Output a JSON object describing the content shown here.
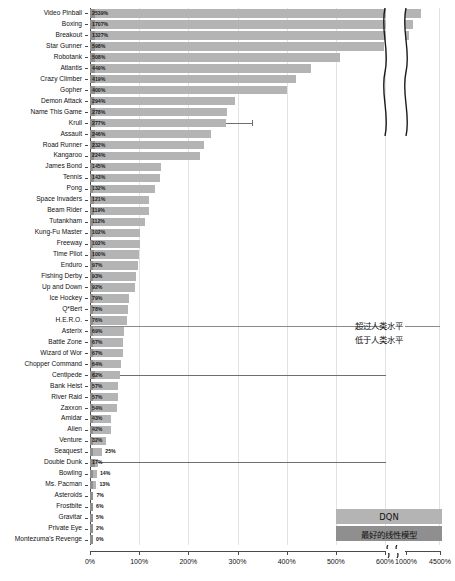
{
  "chart_data": {
    "type": "bar",
    "title": "",
    "xlabel": "",
    "ylabel": "",
    "orientation": "horizontal",
    "grid": true,
    "axis_break": {
      "from": 600,
      "to": 1000
    },
    "xlim": [
      0,
      4500
    ],
    "xticks": [
      {
        "value": 0,
        "label": "0%"
      },
      {
        "value": 100,
        "label": "100%"
      },
      {
        "value": 200,
        "label": "200%"
      },
      {
        "value": 300,
        "label": "300%"
      },
      {
        "value": 400,
        "label": "400%"
      },
      {
        "value": 500,
        "label": "500%"
      },
      {
        "value": 600,
        "label": "600%"
      },
      {
        "value": 1000,
        "label": "1000%"
      },
      {
        "value": 4500,
        "label": "4500%"
      }
    ],
    "reference_line": {
      "value": 100,
      "orientation": "horizontal-separator",
      "after_category": "H.E.R.O."
    },
    "annotations": [
      {
        "text": "超过人类水平",
        "position": "above-reference-line"
      },
      {
        "text": "低于人类水平",
        "position": "below-reference-line"
      }
    ],
    "legend": {
      "position": "bottom-right",
      "entries": [
        {
          "name": "DQN",
          "color": "#b4b4b4"
        },
        {
          "name": "最好的线性模型",
          "color": "#8f8f8f"
        }
      ]
    },
    "categories": [
      "Video Pinball",
      "Boxing",
      "Breakout",
      "Star Gunner",
      "Robotank",
      "Atlantis",
      "Crazy Climber",
      "Gopher",
      "Demon Attack",
      "Name This Game",
      "Krull",
      "Assault",
      "Road Runner",
      "Kangaroo",
      "James Bond",
      "Tennis",
      "Pong",
      "Space Invaders",
      "Beam Rider",
      "Tutankham",
      "Kung-Fu Master",
      "Freeway",
      "Time Pilot",
      "Enduro",
      "Fishing Derby",
      "Up and Down",
      "Ice Hockey",
      "Q*Bert",
      "H.E.R.O.",
      "Asterix",
      "Battle Zone",
      "Wizard of Wor",
      "Chopper Command",
      "Centipede",
      "Bank Heist",
      "River Raid",
      "Zaxxon",
      "Amidar",
      "Alien",
      "Venture",
      "Seaquest",
      "Double Dunk",
      "Bowling",
      "Ms. Pacman",
      "Asteroids",
      "Frostbite",
      "Gravitar",
      "Private Eye",
      "Montezuma's Revenge"
    ],
    "values": [
      2539,
      1707,
      1327,
      598,
      508,
      449,
      419,
      400,
      294,
      278,
      277,
      246,
      232,
      224,
      145,
      143,
      132,
      121,
      119,
      112,
      102,
      102,
      100,
      97,
      93,
      92,
      79,
      78,
      76,
      69,
      67,
      67,
      64,
      62,
      57,
      57,
      54,
      43,
      42,
      32,
      25,
      17,
      14,
      13,
      7,
      6,
      5,
      2,
      0
    ],
    "value_labels": [
      "2539%",
      "1707%",
      "1327%",
      "598%",
      "508%",
      "449%",
      "419%",
      "400%",
      "294%",
      "278%",
      "277%",
      "246%",
      "232%",
      "224%",
      "145%",
      "143%",
      "132%",
      "121%",
      "119%",
      "112%",
      "102%",
      "102%",
      "100%",
      "97%",
      "93%",
      "92%",
      "79%",
      "78%",
      "76%",
      "69%",
      "67%",
      "67%",
      "64%",
      "62%",
      "57%",
      "57%",
      "54%",
      "43%",
      "42%",
      "32%",
      "25%",
      "17%",
      "14%",
      "13%",
      "7%",
      "6%",
      "5%",
      "2%",
      "0%"
    ],
    "linear_model_values": [
      1200,
      350,
      320,
      120,
      95,
      180,
      140,
      110,
      70,
      95,
      330,
      105,
      90,
      75,
      50,
      60,
      48,
      55,
      60,
      45,
      48,
      40,
      52,
      42,
      38,
      45,
      35,
      40,
      34,
      32,
      36,
      34,
      30,
      700,
      28,
      26,
      24,
      20,
      18,
      14,
      25,
      800,
      9,
      8,
      5,
      4,
      3,
      2,
      1
    ],
    "label_outside_flags": [
      false,
      false,
      false,
      false,
      false,
      false,
      false,
      false,
      false,
      false,
      false,
      false,
      false,
      false,
      false,
      false,
      false,
      false,
      false,
      false,
      false,
      false,
      false,
      false,
      false,
      false,
      false,
      false,
      false,
      false,
      false,
      false,
      false,
      false,
      false,
      false,
      false,
      false,
      false,
      false,
      true,
      false,
      true,
      true,
      true,
      true,
      true,
      true,
      true
    ]
  }
}
